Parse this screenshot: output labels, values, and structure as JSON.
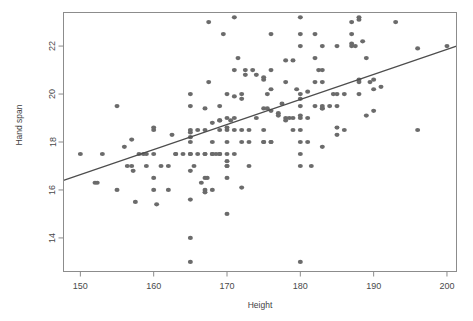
{
  "figure": {
    "background_color": "#ffffff",
    "point_color": "#6b6b6b",
    "line_color": "#4d4d4d",
    "axis_color": "#8c8c8c",
    "title_clipped": "",
    "title_note": "title row is cut off at the top edge of the screenshot"
  },
  "labels": {
    "xlabel": "Height",
    "ylabel": "Hand span",
    "xticks": [
      "150",
      "160",
      "170",
      "180",
      "190",
      "200"
    ],
    "yticks": [
      "14",
      "16",
      "18",
      "20",
      "22"
    ]
  },
  "chart_data": {
    "type": "scatter",
    "title": "",
    "xlabel": "Height",
    "ylabel": "Hand span",
    "xlim": [
      147.7,
      201.3
    ],
    "ylim": [
      12.6,
      23.4
    ],
    "xticks": [
      150,
      160,
      170,
      180,
      190,
      200
    ],
    "yticks": [
      14,
      16,
      18,
      20,
      22
    ],
    "grid": false,
    "legend": null,
    "marker": "filled-circle",
    "marker_color": "#6b6b6b",
    "marker_size_px": 5,
    "trendline": {
      "type": "linear-regression",
      "color": "#4d4d4d",
      "x_start": 147.7,
      "y_start": 16.4,
      "x_end": 201.3,
      "y_end": 22.0,
      "slope": 0.1045,
      "intercept": 0.96
    },
    "n_points": 205,
    "points": [
      [
        150.0,
        17.5
      ],
      [
        152.0,
        16.3
      ],
      [
        152.3,
        16.3
      ],
      [
        153.0,
        17.5
      ],
      [
        155.0,
        19.5
      ],
      [
        155.0,
        16.0
      ],
      [
        156.0,
        17.8
      ],
      [
        156.4,
        17.0
      ],
      [
        157.0,
        17.0
      ],
      [
        157.0,
        18.1
      ],
      [
        157.2,
        16.8
      ],
      [
        157.5,
        15.5
      ],
      [
        158.0,
        17.5
      ],
      [
        158.6,
        17.5
      ],
      [
        159.0,
        17.5
      ],
      [
        159.0,
        17.0
      ],
      [
        160.0,
        18.5
      ],
      [
        160.0,
        18.6
      ],
      [
        160.0,
        16.5
      ],
      [
        160.0,
        16.0
      ],
      [
        160.0,
        17.5
      ],
      [
        160.4,
        15.4
      ],
      [
        161.0,
        17.0
      ],
      [
        162.0,
        17.0
      ],
      [
        162.0,
        16.0
      ],
      [
        162.5,
        18.3
      ],
      [
        163.0,
        17.5
      ],
      [
        163.0,
        17.5
      ],
      [
        164.0,
        17.5
      ],
      [
        165.0,
        20.0
      ],
      [
        165.0,
        19.5
      ],
      [
        165.0,
        18.5
      ],
      [
        165.0,
        18.4
      ],
      [
        165.0,
        18.2
      ],
      [
        165.0,
        18.0
      ],
      [
        165.0,
        17.5
      ],
      [
        165.0,
        17.5
      ],
      [
        165.0,
        16.8
      ],
      [
        165.0,
        15.6
      ],
      [
        165.0,
        14.0
      ],
      [
        165.0,
        13.0
      ],
      [
        165.5,
        17.0
      ],
      [
        166.0,
        17.5
      ],
      [
        166.0,
        18.5
      ],
      [
        166.5,
        16.3
      ],
      [
        167.0,
        19.4
      ],
      [
        167.0,
        18.5
      ],
      [
        167.0,
        17.5
      ],
      [
        167.0,
        17.5
      ],
      [
        167.0,
        16.5
      ],
      [
        167.0,
        16.0
      ],
      [
        167.0,
        15.9
      ],
      [
        167.3,
        16.5
      ],
      [
        167.5,
        20.5
      ],
      [
        167.5,
        23.0
      ],
      [
        168.0,
        18.8
      ],
      [
        168.0,
        18.0
      ],
      [
        168.0,
        17.5
      ],
      [
        168.0,
        17.5
      ],
      [
        168.0,
        16.0
      ],
      [
        168.5,
        17.5
      ],
      [
        169.0,
        19.5
      ],
      [
        169.0,
        18.9
      ],
      [
        169.0,
        18.9
      ],
      [
        169.0,
        18.5
      ],
      [
        169.0,
        17.5
      ],
      [
        169.0,
        17.5
      ],
      [
        169.5,
        22.5
      ],
      [
        170.0,
        20.0
      ],
      [
        170.0,
        19.0
      ],
      [
        170.0,
        18.6
      ],
      [
        170.0,
        18.5
      ],
      [
        170.0,
        18.0
      ],
      [
        170.0,
        17.5
      ],
      [
        170.0,
        17.2
      ],
      [
        170.0,
        17.0
      ],
      [
        170.0,
        17.0
      ],
      [
        170.0,
        16.5
      ],
      [
        170.0,
        15.0
      ],
      [
        170.5,
        18.9
      ],
      [
        171.0,
        23.2
      ],
      [
        171.0,
        21.0
      ],
      [
        171.0,
        19.9
      ],
      [
        171.0,
        19.0
      ],
      [
        171.0,
        18.5
      ],
      [
        171.0,
        17.5
      ],
      [
        171.5,
        21.5
      ],
      [
        172.0,
        20.0
      ],
      [
        172.0,
        19.8
      ],
      [
        172.0,
        18.5
      ],
      [
        172.0,
        18.0
      ],
      [
        172.0,
        16.1
      ],
      [
        172.5,
        21.0
      ],
      [
        172.5,
        20.8
      ],
      [
        173.0,
        18.5
      ],
      [
        173.0,
        18.0
      ],
      [
        173.0,
        17.0
      ],
      [
        173.5,
        21.0
      ],
      [
        174.0,
        20.8
      ],
      [
        174.0,
        19.0
      ],
      [
        175.0,
        20.6
      ],
      [
        175.0,
        20.7
      ],
      [
        175.0,
        19.4
      ],
      [
        175.0,
        18.5
      ],
      [
        175.0,
        18.0
      ],
      [
        175.0,
        18.0
      ],
      [
        175.5,
        20.0
      ],
      [
        175.5,
        19.4
      ],
      [
        176.0,
        22.5
      ],
      [
        176.0,
        21.0
      ],
      [
        176.0,
        20.2
      ],
      [
        176.0,
        19.3
      ],
      [
        176.0,
        18.0
      ],
      [
        176.0,
        18.0
      ],
      [
        177.0,
        19.2
      ],
      [
        177.0,
        19.1
      ],
      [
        177.5,
        19.6
      ],
      [
        178.0,
        21.4
      ],
      [
        178.0,
        20.5
      ],
      [
        178.0,
        19.0
      ],
      [
        178.0,
        18.9
      ],
      [
        178.5,
        19.0
      ],
      [
        179.0,
        21.4
      ],
      [
        179.0,
        19.0
      ],
      [
        179.0,
        18.5
      ],
      [
        179.5,
        20.2
      ],
      [
        180.0,
        23.2
      ],
      [
        180.0,
        22.5
      ],
      [
        180.0,
        22.0
      ],
      [
        180.0,
        20.0
      ],
      [
        180.0,
        19.8
      ],
      [
        180.0,
        19.5
      ],
      [
        180.0,
        19.1
      ],
      [
        180.0,
        19.0
      ],
      [
        180.0,
        18.5
      ],
      [
        180.0,
        18.0
      ],
      [
        180.0,
        17.5
      ],
      [
        180.0,
        17.0
      ],
      [
        180.0,
        13.0
      ],
      [
        181.0,
        20.1
      ],
      [
        181.0,
        19.0
      ],
      [
        181.0,
        18.0
      ],
      [
        181.5,
        17.0
      ],
      [
        182.0,
        22.5
      ],
      [
        182.0,
        21.5
      ],
      [
        182.0,
        20.5
      ],
      [
        182.0,
        19.5
      ],
      [
        182.5,
        21.0
      ],
      [
        183.0,
        22.0
      ],
      [
        183.0,
        21.0
      ],
      [
        183.0,
        20.5
      ],
      [
        183.0,
        19.5
      ],
      [
        183.0,
        19.4
      ],
      [
        183.0,
        19.4
      ],
      [
        183.0,
        17.8
      ],
      [
        184.0,
        19.5
      ],
      [
        184.5,
        20.0
      ],
      [
        185.0,
        22.0
      ],
      [
        185.0,
        20.0
      ],
      [
        185.0,
        19.5
      ],
      [
        185.0,
        18.6
      ],
      [
        185.0,
        18.3
      ],
      [
        186.0,
        20.0
      ],
      [
        186.0,
        18.5
      ],
      [
        187.0,
        23.0
      ],
      [
        187.0,
        22.5
      ],
      [
        187.0,
        22.1
      ],
      [
        187.0,
        22.0
      ],
      [
        187.5,
        22.0
      ],
      [
        188.0,
        23.2
      ],
      [
        188.0,
        23.1
      ],
      [
        188.0,
        20.6
      ],
      [
        188.0,
        20.5
      ],
      [
        188.0,
        20.0
      ],
      [
        188.5,
        22.2
      ],
      [
        189.0,
        21.5
      ],
      [
        189.0,
        19.1
      ],
      [
        189.5,
        20.5
      ],
      [
        190.0,
        20.2
      ],
      [
        190.0,
        19.3
      ],
      [
        190.0,
        20.6
      ],
      [
        191.0,
        20.3
      ],
      [
        193.0,
        23.0
      ],
      [
        196.0,
        21.9
      ],
      [
        196.0,
        18.5
      ],
      [
        200.0,
        22.0
      ]
    ]
  }
}
